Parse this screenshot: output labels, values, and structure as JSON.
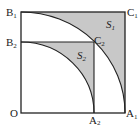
{
  "diagram": {
    "type": "geometry",
    "colors": {
      "line": "#222222",
      "shade": "#c8c8c8",
      "background": "#ffffff"
    },
    "points": {
      "O": {
        "label": "O",
        "sub": ""
      },
      "A1": {
        "label": "A",
        "sub": "1"
      },
      "A2": {
        "label": "A",
        "sub": "2"
      },
      "B1": {
        "label": "B",
        "sub": "1"
      },
      "B2": {
        "label": "B",
        "sub": "2"
      },
      "C1": {
        "label": "C",
        "sub": "1"
      },
      "C2": {
        "label": "C",
        "sub": "2"
      }
    },
    "regions": {
      "S1": {
        "label": "S",
        "sub": "1"
      },
      "S2": {
        "label": "S",
        "sub": "2"
      }
    }
  }
}
